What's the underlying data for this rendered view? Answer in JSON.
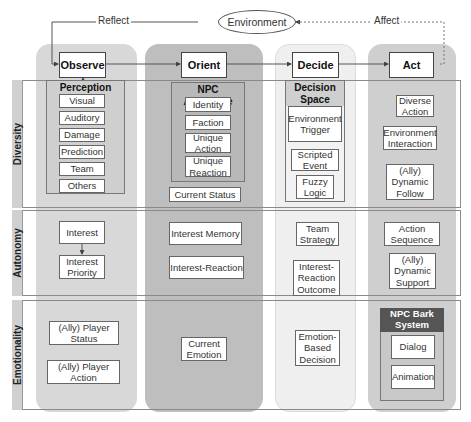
{
  "top": {
    "environment": "Environment",
    "reflect": "Reflect",
    "affect": "Affect"
  },
  "columns": {
    "observe": {
      "label": "Observe",
      "color": "#d8d8d8"
    },
    "orient": {
      "label": "Orient",
      "color": "#bebebe"
    },
    "decide": {
      "label": "Decide",
      "color": "#efefef"
    },
    "act": {
      "label": "Act",
      "color": "#cfcfcf"
    }
  },
  "rows": {
    "diversity": "Diversity",
    "autonomy": "Autonomy",
    "emotionality": "Emotionality"
  },
  "diversity": {
    "perception": {
      "title": "Perception",
      "items": [
        "Visual",
        "Auditory",
        "Damage",
        "Prediction",
        "Team",
        "Others"
      ]
    },
    "npc_archetype": {
      "title": "NPC Archetype",
      "items": [
        "Identity",
        "Faction",
        "Unique Action",
        "Unique Reaction"
      ]
    },
    "current_status": "Current Status",
    "decision_space": {
      "title": "Decision Space",
      "items": [
        "Environment Trigger",
        "Scripted Event",
        "Fuzzy Logic"
      ]
    },
    "act_items": [
      "Diverse Action",
      "Environment Interaction",
      "(Ally) Dynamic Follow"
    ]
  },
  "autonomy": {
    "observe": [
      "Interest",
      "Interest Priority"
    ],
    "orient": [
      "Interest Memory",
      "Interest-Reaction"
    ],
    "decide": [
      "Team Strategy",
      "Interest-Reaction Outcome"
    ],
    "act": [
      "Action Sequence",
      "(Ally) Dynamic Support"
    ]
  },
  "emotionality": {
    "observe": [
      "(Ally) Player Status",
      "(Ally) Player Action"
    ],
    "orient": [
      "Current Emotion"
    ],
    "decide": [
      "Emotion-Based Decision"
    ],
    "bark": {
      "title": "NPC Bark System",
      "items": [
        "Dialog",
        "Animation"
      ],
      "title_bg": "#555555"
    }
  }
}
